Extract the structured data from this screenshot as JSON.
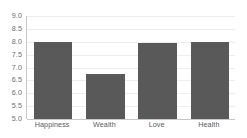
{
  "chart_data": {
    "type": "bar",
    "title": "",
    "subtitle": "",
    "xlabel": "",
    "ylabel": "",
    "categories": [
      "Happiness",
      "Wealth",
      "Love",
      "Health"
    ],
    "values": [
      8.0,
      6.75,
      7.95,
      7.98
    ],
    "series": [
      {
        "name": "",
        "values": [
          8.0,
          6.75,
          7.95,
          7.98
        ]
      }
    ],
    "ylim": [
      5.0,
      9.0
    ],
    "ytick_step": 0.5,
    "ytick_labels": [
      "9.0",
      "8.5",
      "8.0",
      "7.5",
      "7.0",
      "6.5",
      "6.0",
      "5.5",
      "5.0"
    ],
    "ytick_values": [
      9.0,
      8.5,
      8.0,
      7.5,
      7.0,
      6.5,
      6.0,
      5.5,
      5.0
    ],
    "grid": true,
    "grid_axis": "y",
    "legend": false,
    "legend_position": "none",
    "annotations": [],
    "bar_color": "#595959",
    "gridline_color": "#ededed",
    "axis_color": "#c8c8c8",
    "tick_label_color": "#6d6d6d",
    "category_label_color": "#595959",
    "background_color": "#ffffff"
  }
}
